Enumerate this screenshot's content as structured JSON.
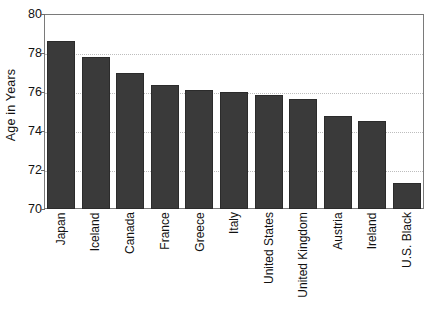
{
  "chart_data": {
    "type": "bar",
    "title": "",
    "subtitle": "",
    "xlabel": "",
    "ylabel": "Age in Years",
    "ylim": [
      70,
      80
    ],
    "ytick_labels": [
      "80",
      "78",
      "76",
      "74",
      "72",
      "70"
    ],
    "yticks": [
      80,
      78,
      76,
      74,
      72,
      70
    ],
    "gridlines": [
      78,
      76,
      74,
      72
    ],
    "grid": true,
    "legend": null,
    "bar_color": "#3a3a3a",
    "categories": [
      "Japan",
      "Iceland",
      "Canada",
      "France",
      "Greece",
      "Italy",
      "United States",
      "United Kingdom",
      "Austria",
      "Ireland",
      "U.S. Black"
    ],
    "values": [
      78.6,
      77.8,
      77.0,
      76.35,
      76.1,
      76.0,
      75.85,
      75.65,
      74.75,
      74.5,
      71.35
    ]
  },
  "colors": {
    "bar_fill": "#3a3a3a",
    "bar_edge": "#2b2b2b",
    "axis_frame": "#7a7a7a",
    "gridline": "#bdbdbd",
    "text": "#111111",
    "background": "#ffffff"
  }
}
